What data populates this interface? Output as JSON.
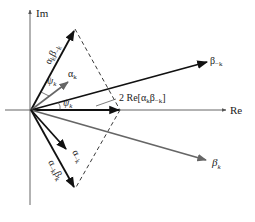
{
  "figure": {
    "type": "phasor-diagram",
    "axes": {
      "imag_label": "Im",
      "real_label": "Re"
    },
    "vectors": [
      {
        "id": "alpha_k_beta_minus_k",
        "label_base": "α",
        "label_sub": "k",
        "label_base2": "β",
        "label_sub2": "−k",
        "style": "dark"
      },
      {
        "id": "alpha_k",
        "label_base": "α",
        "label_sub": "k",
        "style": "gray"
      },
      {
        "id": "beta_minus_k",
        "label_base": "β",
        "label_sub": "−k",
        "style": "dark"
      },
      {
        "id": "two_re",
        "label": "2 Re[",
        "label_base": "α",
        "label_sub": "k",
        "label_base2": "β",
        "label_sub2": "−k",
        "label_close": "]",
        "style": "dark"
      },
      {
        "id": "beta_k",
        "label_base": "β",
        "label_sub": "k",
        "style": "gray"
      },
      {
        "id": "alpha_minus_k",
        "label_base": "α",
        "label_sub": "−k",
        "style": "dark"
      },
      {
        "id": "alpha_minus_k_beta_k",
        "label_base": "α",
        "label_sub": "−k",
        "label_base2": "β",
        "label_sub2": "k",
        "style": "dark"
      }
    ],
    "angles": [
      {
        "id": "psi_upper",
        "label_base": "ψ",
        "label_sub": "k"
      },
      {
        "id": "psi_lower",
        "label_base": "ψ",
        "label_sub": "k"
      }
    ]
  }
}
